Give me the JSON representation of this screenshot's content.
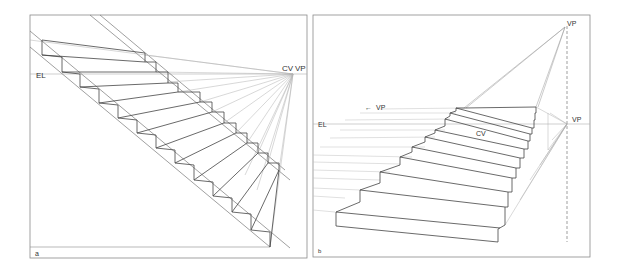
{
  "panels": [
    {
      "id": "a",
      "label": "a",
      "annotations": {
        "eye_level": "EL",
        "center_of_vision": "CV",
        "vanishing_point": "VP"
      },
      "description": "Staircase in perspective, descending steps converging to a single vanishing point on the eye level"
    },
    {
      "id": "b",
      "label": "b",
      "annotations": {
        "eye_level": "EL",
        "center_of_vision": "CV",
        "vanishing_point_upper": "VP",
        "vanishing_point_right": "VP",
        "vanishing_point_left": "VP",
        "left_arrow": "←"
      },
      "description": "Ascending staircase in perspective with an inclined vanishing point above the horizon and side vanishing point on the eye level"
    }
  ],
  "colors": {
    "frame": "#8a8a8a",
    "line": "#555555",
    "light_line": "#b0b0b0",
    "text": "#333333"
  }
}
